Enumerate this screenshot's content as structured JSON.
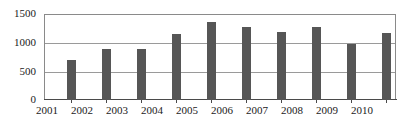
{
  "chart_data": {
    "type": "bar",
    "title": "",
    "xlabel": "",
    "ylabel": "",
    "categories": [
      "2001",
      "2002",
      "2003",
      "2004",
      "2005",
      "2006",
      "2007",
      "2008",
      "2009",
      "2010"
    ],
    "values": [
      700,
      890,
      885,
      1145,
      1355,
      1280,
      1180,
      1280,
      975,
      1170
    ],
    "series": [
      {
        "name": "",
        "values": [
          700,
          890,
          885,
          1145,
          1355,
          1280,
          1180,
          1280,
          975,
          1170
        ]
      }
    ],
    "ylim": [
      0,
      1500
    ],
    "yticks": [
      0,
      500,
      1000,
      1500
    ],
    "ytick_labels": [
      "0",
      "500",
      "1000",
      "1500"
    ],
    "xtick_labels": [
      "2001",
      "2002",
      "2003",
      "2004",
      "2005",
      "2006",
      "2007",
      "2008",
      "2009",
      "2010"
    ],
    "grid": true,
    "grid_axis": "y",
    "legend": false,
    "legend_position": "none",
    "bar_color": "#565656",
    "gridline_color": "#9a9a9a",
    "axis_color": "#4a4a4a",
    "plot_border_color": "#8a8a8a",
    "background_color": "#ffffff",
    "text_color": "#1a1a1a"
  }
}
